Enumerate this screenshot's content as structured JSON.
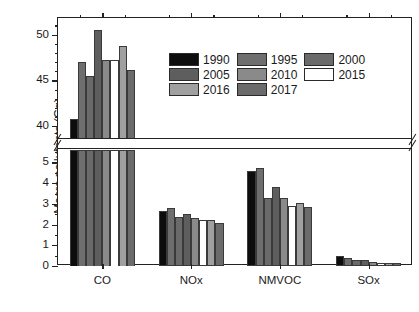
{
  "chart_data": {
    "type": "bar",
    "title": "",
    "xlabel": "",
    "ylabel": "Macro pollutants (Gg)",
    "categories": [
      "CO",
      "NOx",
      "NMVOC",
      "SOx"
    ],
    "grid": false,
    "legend_position": "upper-center",
    "broken_axis": true,
    "lower_axis": {
      "ylim": [
        0,
        5.6
      ],
      "ticks": [
        0,
        1,
        2,
        3,
        4,
        5
      ]
    },
    "upper_axis": {
      "ylim": [
        38.6,
        51.8
      ],
      "ticks": [
        40,
        45,
        50
      ]
    },
    "series": [
      {
        "name": "1990",
        "color": "#0d0d0d",
        "values": [
          40.8,
          2.65,
          4.6,
          0.5
        ]
      },
      {
        "name": "1995",
        "color": "#6e6e6e",
        "values": [
          47.0,
          2.8,
          4.75,
          0.4
        ]
      },
      {
        "name": "2000",
        "color": "#6a6a6a",
        "values": [
          45.5,
          2.35,
          3.3,
          0.3
        ]
      },
      {
        "name": "2005",
        "color": "#5e5e5e",
        "values": [
          50.5,
          2.5,
          3.8,
          0.3
        ]
      },
      {
        "name": "2010",
        "color": "#8a8a8a",
        "values": [
          47.2,
          2.3,
          3.3,
          0.2
        ]
      },
      {
        "name": "2015",
        "color": "#ffffff",
        "values": [
          47.2,
          2.2,
          2.9,
          0.15
        ]
      },
      {
        "name": "2016",
        "color": "#a0a0a0",
        "values": [
          48.8,
          2.2,
          3.05,
          0.15
        ]
      },
      {
        "name": "2017",
        "color": "#6b6b6b",
        "values": [
          46.1,
          2.1,
          2.85,
          0.15
        ]
      }
    ]
  },
  "legend": {
    "entries": [
      {
        "label": "1990"
      },
      {
        "label": "1995"
      },
      {
        "label": "2000"
      },
      {
        "label": "2005"
      },
      {
        "label": "2010"
      },
      {
        "label": "2015"
      },
      {
        "label": "2016"
      },
      {
        "label": "2017"
      }
    ]
  }
}
